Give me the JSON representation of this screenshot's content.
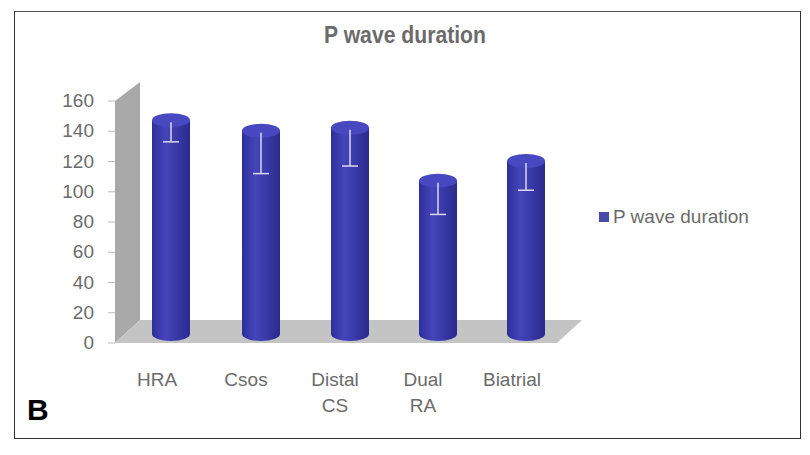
{
  "panel_label": "B",
  "chart_data": {
    "type": "bar",
    "style": "3d-cylinder",
    "title": "P wave duration",
    "xlabel": "",
    "ylabel": "",
    "ylim": [
      0,
      160
    ],
    "yticks": [
      "0",
      "20",
      "40",
      "60",
      "80",
      "100",
      "120",
      "140",
      "160"
    ],
    "categories": [
      "HRA",
      "Csos",
      "Distal CS",
      "Dual RA",
      "Biatrial"
    ],
    "series": [
      {
        "name": "P wave duration",
        "color": "#3b3bb0",
        "values": [
          150,
          143,
          145,
          110,
          123
        ],
        "error_lower": [
          133,
          112,
          117,
          85,
          101
        ]
      }
    ],
    "legend": {
      "position": "right",
      "entries": [
        "P wave duration"
      ]
    },
    "grid": false
  },
  "axis": {
    "yticks": [
      "0",
      "20",
      "40",
      "60",
      "80",
      "100",
      "120",
      "140",
      "160"
    ],
    "xlabels": [
      [
        "HRA"
      ],
      [
        "Csos"
      ],
      [
        "Distal",
        "CS"
      ],
      [
        "Dual",
        "RA"
      ],
      [
        "Biatrial"
      ]
    ]
  },
  "legend_label": "P wave duration"
}
